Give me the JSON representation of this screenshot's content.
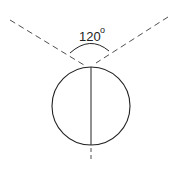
{
  "diagram": {
    "angle_label": "120",
    "angle_unit": "o",
    "stroke_color": "#222222",
    "background": "#ffffff",
    "shapes": {
      "left_lobe": {
        "cx": 62,
        "cy": 106,
        "r": 34
      },
      "right_lobe": {
        "cx": 118,
        "cy": 106,
        "r": 34
      },
      "contact_line": {
        "x": 91,
        "y1": 67,
        "y2": 145
      }
    }
  }
}
